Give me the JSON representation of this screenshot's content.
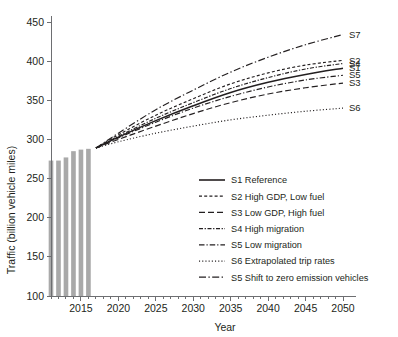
{
  "chart_data": {
    "type": "line",
    "title": "",
    "xlabel": "Year",
    "ylabel": "Traffic (billion vehicle miles)",
    "xlim": [
      2011,
      2050
    ],
    "ylim": [
      100,
      450
    ],
    "yticks": [
      100,
      150,
      200,
      250,
      300,
      350,
      400,
      450
    ],
    "xticks": [
      2015,
      2020,
      2025,
      2030,
      2035,
      2040,
      2045,
      2050
    ],
    "xminor_step": 1,
    "grid": false,
    "legend_position": "inside-lower-right",
    "bar_series": {
      "name": "Historic traffic",
      "color": "#a9a9a9",
      "x": [
        2011,
        2012,
        2013,
        2014,
        2015,
        2016
      ],
      "values": [
        273,
        273,
        277,
        285,
        287,
        288
      ]
    },
    "x": [
      2017,
      2020,
      2025,
      2030,
      2035,
      2040,
      2045,
      2050
    ],
    "series": [
      {
        "name": "S1",
        "label": "S1 Reference",
        "style": "solid",
        "tag": "S1",
        "values": [
          289,
          303,
          324,
          343,
          360,
          373,
          383,
          391
        ]
      },
      {
        "name": "S2",
        "label": "S2 High GDP, Low fuel",
        "style": "dashed-short",
        "tag": "S2",
        "values": [
          289,
          306,
          331,
          352,
          371,
          385,
          395,
          401
        ]
      },
      {
        "name": "S3",
        "label": "S3 Low GDP, High fuel",
        "style": "dashed-long",
        "tag": "S3",
        "values": [
          289,
          300,
          317,
          333,
          347,
          358,
          366,
          372
        ]
      },
      {
        "name": "S4",
        "label": "S4 High migration",
        "style": "dash-dot-dense",
        "tag": "S4",
        "values": [
          289,
          304,
          327,
          347,
          365,
          379,
          390,
          397
        ]
      },
      {
        "name": "S5",
        "label": "S5 Low migration",
        "style": "dash-dot-wide",
        "tag": "S5",
        "values": [
          289,
          302,
          322,
          340,
          355,
          367,
          376,
          382
        ]
      },
      {
        "name": "S6",
        "label": "S6 Extrapolated trip rates",
        "style": "dotted",
        "tag": "S6",
        "values": [
          289,
          297,
          308,
          317,
          325,
          331,
          336,
          340
        ]
      },
      {
        "name": "S7",
        "label": "S5 Shift to zero emission vehicles",
        "style": "dash-dot",
        "tag": "S7",
        "values": [
          289,
          308,
          338,
          363,
          386,
          405,
          421,
          434
        ]
      }
    ],
    "series_tags": [
      "S7",
      "S2",
      "S4",
      "S1",
      "S5",
      "S3",
      "S6"
    ],
    "legend_entries": [
      "S1 Reference",
      "S2 High GDP, Low fuel",
      "S3 Low GDP, High fuel",
      "S4 High migration",
      "S5 Low migration",
      "S6 Extrapolated trip rates",
      "S5 Shift to zero emission vehicles"
    ],
    "colors": {
      "line": "#231f20",
      "axis": "#6d6e71",
      "bar": "#a9a9a9",
      "background": "#ffffff"
    }
  }
}
